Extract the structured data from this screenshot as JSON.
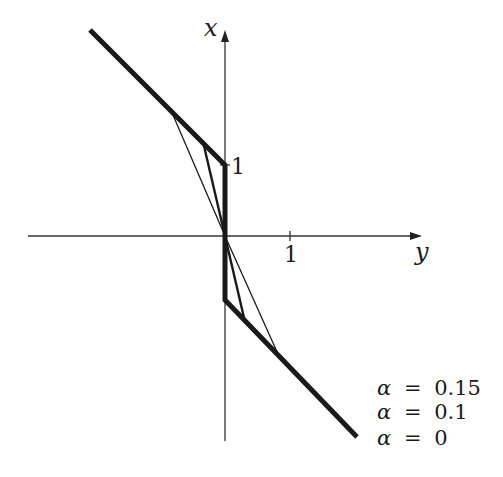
{
  "figure": {
    "type": "diagram",
    "axes": {
      "horizontal_label": "y",
      "vertical_label": "x",
      "horizontal_tick": "1",
      "vertical_tick": "1"
    },
    "legend": [
      {
        "symbol": "α",
        "eq": "=",
        "value": "0.15"
      },
      {
        "symbol": "α",
        "eq": "=",
        "value": "0.1"
      },
      {
        "symbol": "α",
        "eq": "=",
        "value": "0"
      }
    ],
    "colors": {
      "ink": "#1a1a1a",
      "axis": "#333333",
      "background": "#ffffff"
    }
  }
}
